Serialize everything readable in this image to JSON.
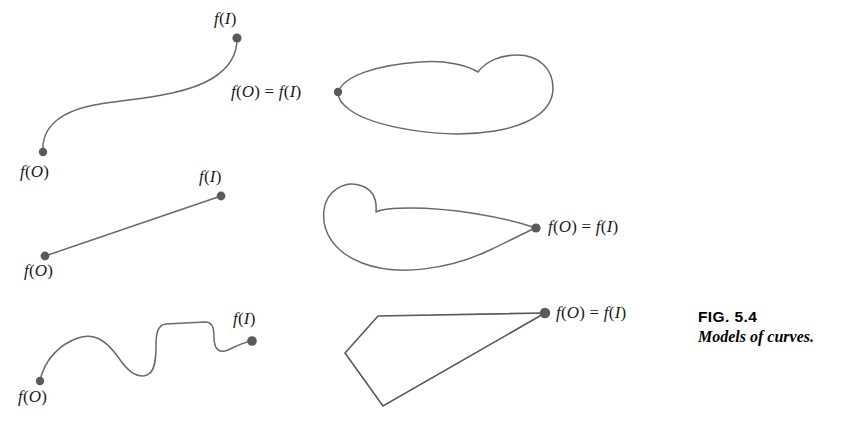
{
  "figure": {
    "caption_number": "FIG.  5.4",
    "caption_text": "Models of curves.",
    "stroke_color": "#696969",
    "dot_color": "#5a5a5a",
    "background_color": "#ffffff"
  },
  "labels": {
    "arc_open_start": "f(O)",
    "arc_open_end": "f(I)",
    "loop_closed": "f(O) = f(I)",
    "segment_start": "f(O)",
    "segment_end": "f(I)",
    "teardrop_closed": "f(O) = f(I)",
    "wavy_start": "f(O)",
    "wavy_end": "f(I)",
    "polygon_closed": "f(O) = f(I)"
  },
  "models": [
    {
      "name": "open-arc",
      "kind": "open curve",
      "start_point": [
        43,
        152
      ],
      "end_point": [
        237,
        38
      ]
    },
    {
      "name": "closed-loop",
      "kind": "closed curve",
      "basepoint": [
        338,
        92
      ]
    },
    {
      "name": "straight-segment",
      "kind": "open curve",
      "start_point": [
        45,
        256
      ],
      "end_point": [
        221,
        196
      ]
    },
    {
      "name": "teardrop-loop",
      "kind": "closed curve",
      "basepoint": [
        536,
        228
      ]
    },
    {
      "name": "wavy-arc",
      "kind": "open curve",
      "start_point": [
        40,
        381
      ],
      "end_point": [
        252,
        341
      ]
    },
    {
      "name": "quadrilateral",
      "kind": "closed curve",
      "basepoint": [
        545,
        313
      ],
      "vertices": [
        [
          545,
          313
        ],
        [
          378,
          316
        ],
        [
          345,
          353
        ],
        [
          383,
          406
        ]
      ]
    }
  ]
}
